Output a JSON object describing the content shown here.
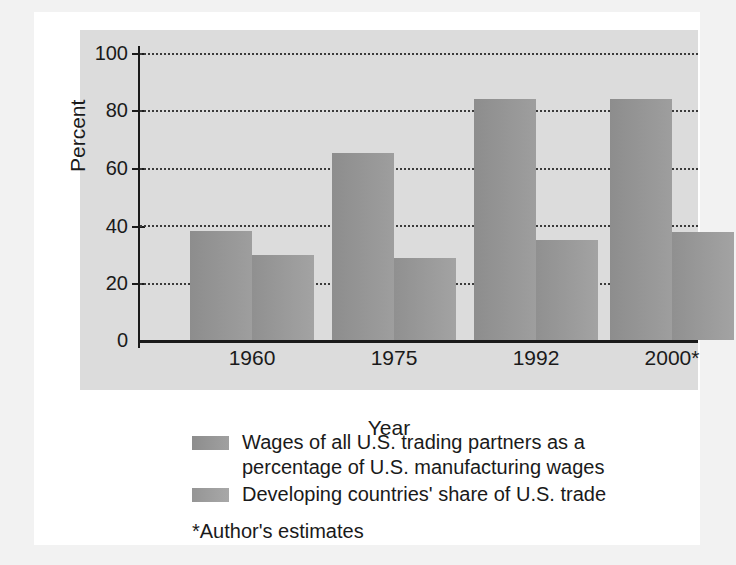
{
  "chart_data": {
    "type": "bar",
    "title": "",
    "subtitle": "",
    "xlabel": "Year",
    "ylabel": "Percent",
    "categories": [
      "1960",
      "1975",
      "1992",
      "2000*"
    ],
    "series": [
      {
        "name": "Wages of all U.S. trading partners as a percentage of U.S. manufacturing wages",
        "color": "#8d8d8d",
        "values": [
          38,
          65,
          84,
          84
        ]
      },
      {
        "name": "Developing countries' share of U.S. trade",
        "color": "#9a9a9a",
        "values": [
          29.5,
          28.5,
          35,
          37.5
        ]
      }
    ],
    "ylim": [
      0,
      100
    ],
    "yticks": [
      0,
      20,
      40,
      60,
      80,
      100
    ],
    "ytick_labels": [
      "0",
      "20",
      "40",
      "60",
      "80",
      "100"
    ],
    "grid": "horizontal-dotted",
    "legend_position": "below",
    "annotations": [
      "*Author's estimates"
    ]
  },
  "axes": {
    "y_label": "Percent",
    "x_label": "Year"
  },
  "legend": {
    "entries": [
      {
        "line1": "Wages of all U.S. trading partners as a",
        "line2": "percentage of U.S. manufacturing wages"
      },
      {
        "line1": "Developing countries' share of U.S. trade",
        "line2": ""
      }
    ]
  },
  "footnote": "*Author's estimates",
  "colors": {
    "series_1": "#8d8d8d",
    "series_2": "#9a9a9a",
    "plot_background": "#dcdcdc",
    "page_background": "#f2f2f2",
    "card_background": "#ffffff",
    "axis": "#1a1a1a"
  }
}
